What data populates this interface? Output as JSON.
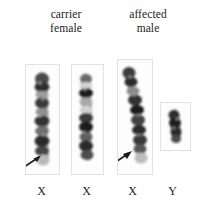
{
  "figure": {
    "kind": "karyotype-comparison",
    "background_color": "#ffffff",
    "panel_border_color": "#e2e2e2",
    "ink_color": "#1b1b1b"
  },
  "headers": [
    {
      "id": "carrier-female",
      "text": "carrier\nfemale"
    },
    {
      "id": "affected-male",
      "text": "affected\nmale"
    }
  ],
  "chromosomes": [
    {
      "id": "x1",
      "label": "X",
      "group": "carrier-female",
      "type": "X",
      "shape": "straight",
      "arrow": true,
      "arrow_target": "distal long arm",
      "bands": [
        "dark",
        "light",
        "dark",
        "light",
        "dark",
        "light",
        "dark",
        "pale-terminal"
      ]
    },
    {
      "id": "x2",
      "label": "X",
      "group": "carrier-female",
      "type": "X",
      "shape": "straight",
      "arrow": false,
      "bands": [
        "light",
        "dark",
        "light",
        "dark",
        "light",
        "dark",
        "dark"
      ]
    },
    {
      "id": "x3",
      "label": "X",
      "group": "affected-male",
      "type": "X",
      "shape": "curved",
      "arrow": true,
      "arrow_target": "distal long arm",
      "bands": [
        "dark",
        "light",
        "dark",
        "dark",
        "light",
        "dark",
        "dark",
        "pale-terminal"
      ]
    },
    {
      "id": "y1",
      "label": "Y",
      "group": "affected-male",
      "type": "Y",
      "shape": "short-stubby",
      "arrow": false,
      "bands": [
        "dark",
        "dark"
      ]
    }
  ],
  "labels": {
    "x1": "X",
    "x2": "X",
    "x3": "X",
    "y1": "Y"
  },
  "annotations": {
    "arrow_count": 2,
    "arrow_direction": "up-right",
    "arrow_color": "#1a1a1a"
  }
}
